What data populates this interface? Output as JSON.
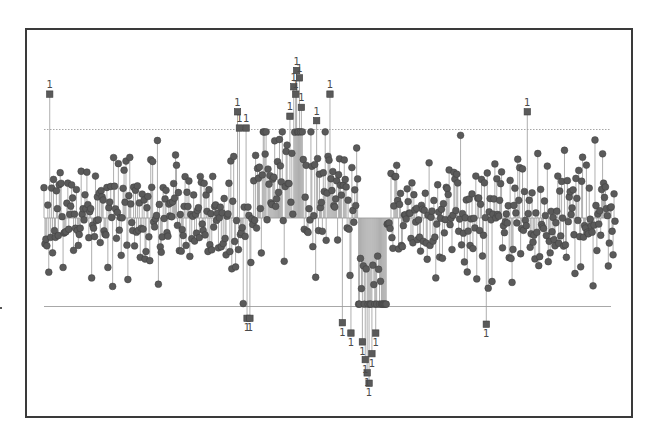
{
  "chart_data": {
    "type": "scatter",
    "subtype": "control-chart-individuals",
    "title": "",
    "xlabel": "",
    "ylabel": "",
    "grid": false,
    "legend": null,
    "n_points": 600,
    "limits": {
      "ucl": 3.0,
      "center": 0.0,
      "lcl": -3.0,
      "ucl_style": "dotted",
      "center_style": "solid",
      "lcl_style": "solid"
    },
    "ylim": [
      -6.0,
      5.0
    ],
    "in_control_marker": "circle",
    "out_of_control_marker": "square",
    "out_of_control_label": "1",
    "regions": [
      {
        "x_start": 0,
        "x_end": 200,
        "mean": 0.1,
        "sd": 1.0,
        "note": "stable"
      },
      {
        "x_start": 200,
        "x_end": 220,
        "mean": -0.6,
        "sd": 1.1,
        "note": "dip near index ~215"
      },
      {
        "x_start": 220,
        "x_end": 275,
        "mean": 1.2,
        "sd": 1.1,
        "note": "rising to peak"
      },
      {
        "x_start": 262,
        "x_end": 272,
        "mean": 3.4,
        "sd": 0.6,
        "note": "upward spike, many points > UCL"
      },
      {
        "x_start": 275,
        "x_end": 330,
        "mean": 0.9,
        "sd": 1.1,
        "note": "falling"
      },
      {
        "x_start": 330,
        "x_end": 360,
        "mean": -2.8,
        "sd": 1.0,
        "note": "downward spike, many points < LCL"
      },
      {
        "x_start": 360,
        "x_end": 600,
        "mean": 0.1,
        "sd": 1.0,
        "note": "stable"
      }
    ],
    "out_of_control_points": [
      {
        "x": 6,
        "y": 4.2,
        "label": "1"
      },
      {
        "x": 203,
        "y": 3.6,
        "label": "1"
      },
      {
        "x": 205,
        "y": 3.05,
        "label": "1"
      },
      {
        "x": 212,
        "y": 3.05,
        "label": "1"
      },
      {
        "x": 213,
        "y": -3.4,
        "label": "1"
      },
      {
        "x": 216,
        "y": -3.4,
        "label": "1"
      },
      {
        "x": 265,
        "y": 5.0,
        "label": "1"
      },
      {
        "x": 268,
        "y": 4.75,
        "label": "1"
      },
      {
        "x": 262,
        "y": 4.45,
        "label": "1"
      },
      {
        "x": 264,
        "y": 4.2,
        "label": "1"
      },
      {
        "x": 270,
        "y": 3.75,
        "label": "1"
      },
      {
        "x": 258,
        "y": 3.45,
        "label": "1"
      },
      {
        "x": 286,
        "y": 3.3,
        "label": "1"
      },
      {
        "x": 300,
        "y": 4.2,
        "label": "1"
      },
      {
        "x": 313,
        "y": -3.55,
        "label": "1"
      },
      {
        "x": 322,
        "y": -3.9,
        "label": "1"
      },
      {
        "x": 334,
        "y": -4.2,
        "label": "1"
      },
      {
        "x": 337,
        "y": -4.8,
        "label": "1"
      },
      {
        "x": 339,
        "y": -5.25,
        "label": "1"
      },
      {
        "x": 341,
        "y": -5.6,
        "label": "1"
      },
      {
        "x": 344,
        "y": -4.6,
        "label": "1"
      },
      {
        "x": 348,
        "y": -3.9,
        "label": "1"
      },
      {
        "x": 464,
        "y": -3.6,
        "label": "1"
      },
      {
        "x": 507,
        "y": 3.6,
        "label": "1"
      }
    ],
    "random_seed": 20240611
  },
  "colors": {
    "marker_fill": "#5a5a5a",
    "marker_edge": "#3f3f3f",
    "stem": "#9a9a9a",
    "limit_line": "#a8a8a8",
    "frame": "#3a3a3a",
    "label": "#4a4a4a"
  },
  "plot_area_px": {
    "x0": 44,
    "x1": 615,
    "y_ucl": 130,
    "y_center": 218,
    "y_lcl": 307,
    "line_x0": 44,
    "line_x1": 611
  }
}
